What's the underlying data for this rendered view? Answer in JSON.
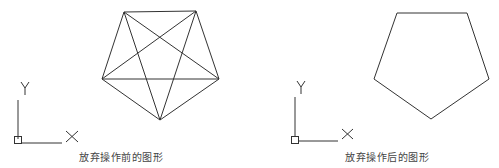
{
  "panels": [
    {
      "name": "before",
      "caption": "放弃操作前的图形",
      "pentagon": {
        "vertices": [
          [
            124,
            12
          ],
          [
            196,
            11
          ],
          [
            219,
            79
          ],
          [
            160,
            120
          ],
          [
            102,
            79
          ]
        ],
        "diagonals": true
      },
      "ucs": {
        "x_label": "X",
        "y_label": "Y"
      }
    },
    {
      "name": "after",
      "caption": "放弃操作后的图形",
      "pentagon": {
        "vertices": [
          [
            397,
            13
          ],
          [
            467,
            13
          ],
          [
            489,
            79
          ],
          [
            431,
            119
          ],
          [
            374,
            79
          ]
        ],
        "diagonals": false
      },
      "ucs": {
        "x_label": "X",
        "y_label": "Y"
      }
    }
  ],
  "colors": {
    "line": "#333333",
    "text": "#444444"
  }
}
